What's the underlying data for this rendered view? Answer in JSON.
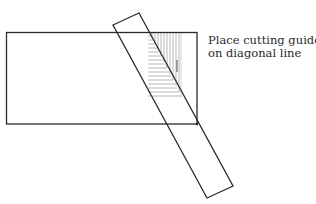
{
  "caption": {
    "line1": "Place cutting guide",
    "line2": "on diagonal line"
  },
  "colors": {
    "stroke": "#2a2a2a",
    "hatch": "#8a8a8a",
    "background": "#ffffff"
  },
  "shapes": {
    "panel_rectangle": "rectangle",
    "cutting_guide": "diagonal strip",
    "cut_zone": "hatched region"
  }
}
